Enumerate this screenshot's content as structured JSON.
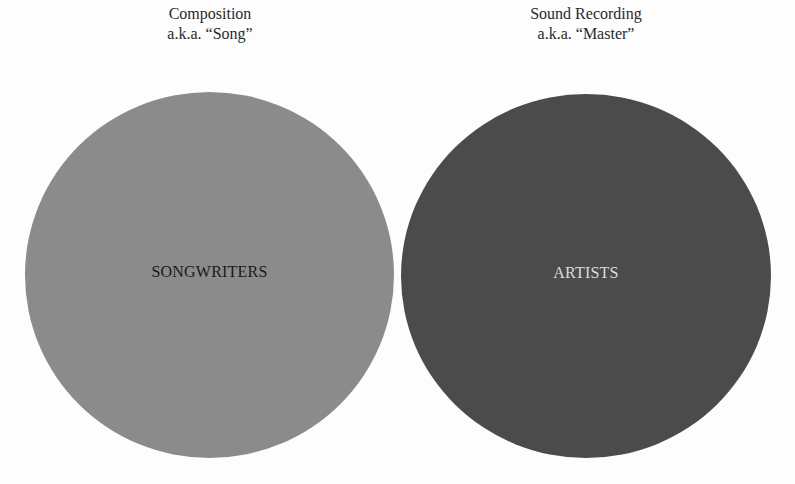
{
  "diagram": {
    "type": "two-circle comparison",
    "left": {
      "caption_line1": "Composition",
      "caption_line2": "a.k.a. “Song”",
      "label": "SONGWRITERS",
      "fill_color": "#8b8b8b",
      "label_color": "#1a1a1a"
    },
    "right": {
      "caption_line1": "Sound Recording",
      "caption_line2": "a.k.a. “Master”",
      "label": "ARTISTS",
      "fill_color": "#4b4b4b",
      "label_color": "#dcdcdc"
    }
  }
}
